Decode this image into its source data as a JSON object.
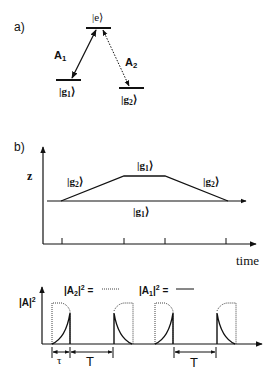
{
  "panel_a": {
    "label": "a)",
    "excited_state": "|e⟩",
    "ground_1": {
      "prefix": "|g",
      "sub": "1",
      "suffix": "⟩"
    },
    "ground_2": {
      "prefix": "|g",
      "sub": "2",
      "suffix": "⟩"
    },
    "transition_1": {
      "name": "A",
      "sub": "1",
      "style": "solid"
    },
    "transition_2": {
      "name": "A",
      "sub": "2",
      "style": "dotted"
    }
  },
  "panel_b": {
    "label": "b)",
    "y_axis_label": "z",
    "x_axis_label": "time",
    "region_labels": {
      "left": {
        "prefix": "|g",
        "sub": "2",
        "suffix": "⟩"
      },
      "top": {
        "prefix": "|g",
        "sub": "1",
        "suffix": "⟩"
      },
      "right": {
        "prefix": "|g",
        "sub": "2",
        "suffix": "⟩"
      },
      "bottom": {
        "prefix": "|g",
        "sub": "1",
        "suffix": "⟩"
      }
    },
    "trajectory": "trapezoid",
    "tick_count": 4
  },
  "panel_c": {
    "y_axis_label": {
      "text": "|A|",
      "sup": "2"
    },
    "legend": [
      {
        "text": "|A",
        "sub": "2",
        "tail": "|",
        "sup": "2",
        "eq": "=",
        "style": "dotted"
      },
      {
        "text": "|A",
        "sub": "1",
        "tail": "|",
        "sup": "2",
        "eq": "=",
        "style": "solid"
      }
    ],
    "pulse_count": 4,
    "interval_labels": {
      "tau": "τ",
      "period": "T"
    }
  },
  "colors": {
    "ink": "#111111",
    "background": "#ffffff"
  }
}
